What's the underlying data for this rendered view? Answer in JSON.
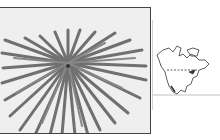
{
  "figure": {
    "photo": {
      "subject": "palm-like plant rosette viewed from above",
      "icon": "plant-photo"
    },
    "range_map": {
      "subject": "North America outline range map",
      "icon": "map-icon"
    }
  },
  "colors": {
    "photo_background": "#efefef",
    "leaf": "#6e6e6e",
    "frame": "#444444",
    "map_line": "#333333"
  }
}
